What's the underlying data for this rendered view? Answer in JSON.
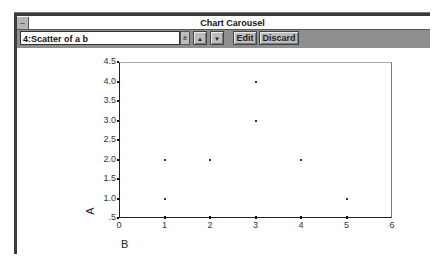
{
  "window": {
    "title": "Chart Carousel",
    "system_menu_glyph": "–"
  },
  "toolbar": {
    "chart_select_value": "4:Scatter of a b",
    "dropdown_glyph": "±",
    "up_glyph": "▲",
    "down_glyph": "▼",
    "edit_label": "Edit",
    "discard_label": "Discard"
  },
  "chart_data": {
    "type": "scatter",
    "title": "",
    "xlabel": "B",
    "ylabel": "A",
    "xlim": [
      0,
      6
    ],
    "ylim": [
      0.5,
      4.5
    ],
    "x_ticks": [
      "0",
      "1",
      "2",
      "3",
      "4",
      "5",
      "6"
    ],
    "y_ticks": [
      ".5",
      "1.0",
      "1.5",
      "2.0",
      "2.5",
      "3.0",
      "3.5",
      "4.0",
      "4.5"
    ],
    "grid": false,
    "legend": null,
    "points": [
      {
        "x": 1,
        "y": 1
      },
      {
        "x": 1,
        "y": 2
      },
      {
        "x": 2,
        "y": 2
      },
      {
        "x": 3,
        "y": 3
      },
      {
        "x": 3,
        "y": 4
      },
      {
        "x": 4,
        "y": 2
      },
      {
        "x": 5,
        "y": 1
      }
    ]
  }
}
